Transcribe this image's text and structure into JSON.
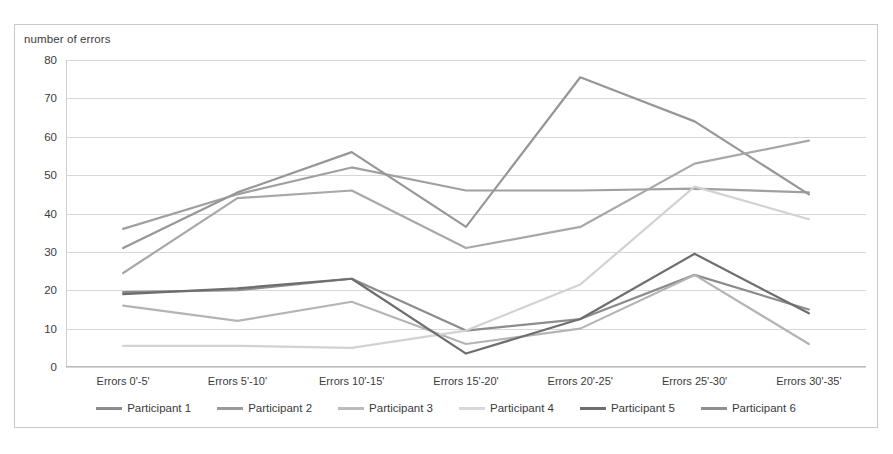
{
  "chart_data": {
    "type": "line",
    "title": "",
    "ylabel": "number of errors",
    "xlabel": "",
    "grid": true,
    "legend_position": "bottom",
    "ylim": [
      0,
      80
    ],
    "yticks": [
      0,
      10,
      20,
      30,
      40,
      50,
      60,
      70,
      80
    ],
    "categories": [
      "Errors 0'-5'",
      "Errors 5'-10'",
      "Errors 10'-15'",
      "Errors 15'-20'",
      "Errors 20'-25'",
      "Errors 25'-30'",
      "Errors 30'-35'"
    ],
    "series": [
      {
        "name": "Participant 1",
        "color": "#8c8c8c",
        "values": [
          19.5,
          20,
          23,
          9.5,
          12.5,
          24,
          15
        ]
      },
      {
        "name": "Participant 2",
        "color": "#a0a0a0",
        "values": [
          36,
          45,
          52,
          46,
          46,
          46.5,
          45.5
        ]
      },
      {
        "name": "Participant 3",
        "color": "#b4b4b4",
        "values": [
          16,
          12,
          17,
          6,
          10,
          24,
          6
        ]
      },
      {
        "name": "Participant 4",
        "color": "#d2d2d2",
        "values": [
          5.5,
          5.5,
          5,
          9.5,
          21.5,
          47,
          38.5
        ]
      },
      {
        "name": "Participant 5",
        "color": "#6e6e6e",
        "values": [
          19,
          20.5,
          23,
          3.5,
          12.5,
          29.5,
          14
        ]
      },
      {
        "name": "Participant 6",
        "color": "#979797",
        "values": [
          31,
          45.5,
          56,
          36.5,
          75.5,
          64,
          45
        ]
      }
    ],
    "series_extra": [
      {
        "name": "Participant 2b",
        "color": "#a8a8a8",
        "values": [
          24.5,
          44,
          46,
          31,
          36.5,
          53,
          59
        ]
      }
    ]
  },
  "legend": {
    "items": [
      {
        "label": "Participant 1",
        "color": "#8c8c8c"
      },
      {
        "label": "Participant 2",
        "color": "#9a9a9a"
      },
      {
        "label": "Participant 3",
        "color": "#bcbcbc"
      },
      {
        "label": "Participant 4",
        "color": "#d8d8d8"
      },
      {
        "label": "Participant 5",
        "color": "#6e6e6e"
      },
      {
        "label": "Participant 6",
        "color": "#8f8f8f"
      }
    ]
  }
}
